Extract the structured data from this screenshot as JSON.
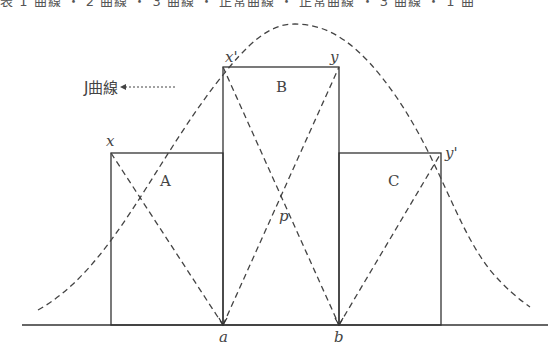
{
  "header": {
    "cutoff_text": "表 1 曲線 ・ 2 曲線 ・ 3 曲線 ・ 正常曲線 ・ 正常曲線 ・ 3 曲線 ・ 1 曲"
  },
  "diagram": {
    "curve_label": "J曲線",
    "blocks": [
      {
        "name": "A",
        "left_corner_label": "x"
      },
      {
        "name": "B",
        "left_corner_label": "x'",
        "right_corner_label": "y"
      },
      {
        "name": "C",
        "right_corner_label": "y'"
      }
    ],
    "intersection_label": "p",
    "axis_points": [
      "a",
      "b"
    ],
    "colors": {
      "stroke": "#333333",
      "dash": "#444444"
    }
  }
}
